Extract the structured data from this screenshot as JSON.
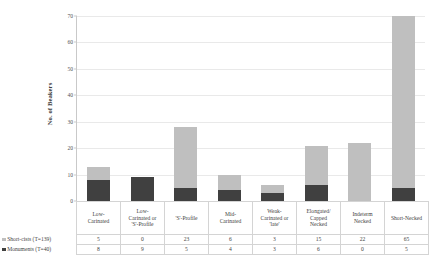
{
  "chart_data": {
    "type": "bar",
    "stacked": true,
    "title": "",
    "xlabel": "",
    "ylabel": "No. of Beakers",
    "ylim": [
      0,
      70
    ],
    "yticks": [
      0,
      10,
      20,
      30,
      40,
      50,
      60,
      70
    ],
    "grid": true,
    "legend_position": "bottom-left",
    "categories": [
      "Low-Carinated",
      "Low-Carinated or 'S'-Profile",
      "'S'-Profile",
      "Mid-Carinated",
      "Weak-Carinated or 'late'",
      "Elongated/Capped Necked",
      "Indeterm Necked",
      "Short-Necked"
    ],
    "series": [
      {
        "name": "Short-cists (T=139)",
        "color": "#bfbfbf",
        "values": [
          5,
          0,
          23,
          6,
          3,
          15,
          22,
          65
        ]
      },
      {
        "name": "Monuments (T=40)",
        "color": "#404040",
        "values": [
          8,
          9,
          5,
          4,
          3,
          6,
          0,
          5
        ]
      }
    ]
  },
  "axis": {
    "ytitle": "No. of Beakers",
    "ticks": [
      "70",
      "60",
      "50",
      "40",
      "30",
      "20",
      "10",
      "0"
    ]
  },
  "table": {
    "categories": [
      "Low-\nCarinated",
      "Low-\nCarinated or\n'S'-Profile",
      "'S'-Profile",
      "Mid-\nCarinated",
      "Weak-\nCarinated or\n'late'",
      "Elongated/\nCapped\nNecked",
      "Indeterm\nNecked",
      "Short-Necked"
    ],
    "rows": [
      {
        "label": "Short-cists (T=139)",
        "color": "#bfbfbf",
        "values": [
          "5",
          "0",
          "23",
          "6",
          "3",
          "15",
          "22",
          "65"
        ]
      },
      {
        "label": "Monuments (T=40)",
        "color": "#404040",
        "values": [
          "8",
          "9",
          "5",
          "4",
          "3",
          "6",
          "0",
          "5"
        ]
      }
    ]
  }
}
